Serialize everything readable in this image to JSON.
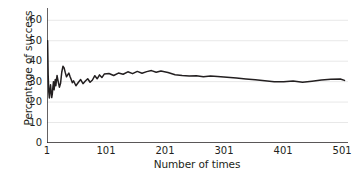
{
  "chart_data": {
    "type": "line",
    "title": "",
    "xlabel": "Number of times",
    "ylabel": "Percentage of success",
    "xlim": [
      1,
      511
    ],
    "ylim": [
      0,
      66
    ],
    "xticks": [
      1,
      101,
      201,
      301,
      401,
      501
    ],
    "xtick_labels": [
      "1",
      "101",
      "201",
      "301",
      "401",
      "501"
    ],
    "yticks": [
      0,
      10,
      20,
      30,
      40,
      50,
      60
    ],
    "ytick_labels": [
      "0",
      "10",
      "20",
      "30",
      "40",
      "50",
      "60"
    ],
    "grid": "horizontal",
    "legend": "none",
    "line_color": "#231f20",
    "grid_color": "#e8e8e8",
    "axis_color": "#231f20",
    "series": [
      {
        "name": "Percentage of success",
        "x": [
          1,
          2,
          3,
          4,
          5,
          6,
          7,
          8,
          9,
          10,
          11,
          12,
          13,
          14,
          15,
          16,
          17,
          18,
          19,
          20,
          22,
          24,
          26,
          28,
          30,
          32,
          34,
          36,
          38,
          40,
          42,
          44,
          46,
          48,
          50,
          54,
          58,
          62,
          66,
          70,
          74,
          78,
          82,
          86,
          90,
          94,
          98,
          106,
          114,
          122,
          130,
          138,
          146,
          154,
          162,
          170,
          178,
          186,
          194,
          206,
          218,
          230,
          242,
          254,
          266,
          278,
          290,
          306,
          322,
          338,
          354,
          370,
          386,
          402,
          418,
          434,
          450,
          466,
          482,
          498,
          505
        ],
        "values": [
          50.0,
          50.0,
          33.3,
          25.0,
          22.0,
          25.5,
          28.5,
          25.0,
          22.2,
          24.0,
          27.3,
          30.0,
          26.0,
          28.6,
          31.0,
          28.0,
          30.6,
          33.0,
          31.5,
          30.0,
          27.3,
          29.2,
          34.6,
          37.5,
          36.7,
          34.4,
          32.4,
          33.3,
          34.2,
          32.5,
          31.0,
          29.5,
          30.4,
          29.2,
          28.0,
          29.6,
          31.0,
          29.0,
          30.3,
          31.4,
          29.7,
          30.8,
          32.9,
          31.4,
          33.3,
          32.0,
          33.7,
          34.0,
          33.0,
          34.2,
          33.6,
          34.8,
          33.9,
          35.0,
          34.1,
          34.9,
          35.4,
          34.6,
          35.2,
          34.5,
          33.4,
          33.0,
          32.7,
          32.9,
          32.4,
          32.8,
          32.5,
          32.2,
          31.8,
          31.3,
          30.9,
          30.4,
          30.0,
          29.9,
          30.3,
          29.7,
          30.2,
          30.8,
          31.2,
          31.3,
          30.6
        ],
        "y_start": 50.0,
        "y_end": 30.6,
        "converges_to": 30.6
      }
    ]
  }
}
